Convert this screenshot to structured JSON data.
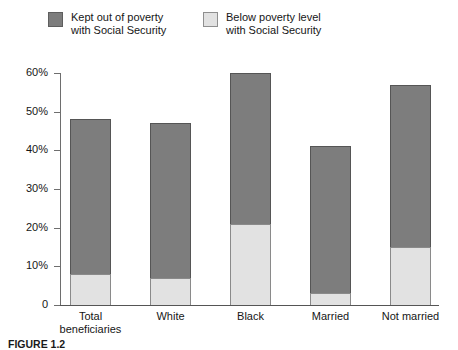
{
  "chart_data": {
    "type": "bar",
    "subtype": "stacked-bar",
    "title": "",
    "xlabel": "",
    "ylabel": "",
    "ylim": [
      0,
      60
    ],
    "ytick_values": [
      0,
      10,
      20,
      30,
      40,
      50,
      60
    ],
    "ytick_labels": [
      "0",
      "10%",
      "20%",
      "30%",
      "40%",
      "50%",
      "60%"
    ],
    "grid": false,
    "legend_position": "top-left",
    "categories": [
      "Total beneficiaries",
      "White",
      "Black",
      "Married",
      "Not married"
    ],
    "category_label_lines": [
      [
        "Total",
        "beneficiaries"
      ],
      [
        "White"
      ],
      [
        "Black"
      ],
      [
        "Married"
      ],
      [
        "Not married"
      ]
    ],
    "series": [
      {
        "name": "Below poverty level with Social Security",
        "color": "#e2e2e2",
        "values": [
          8,
          7,
          21,
          3,
          15
        ]
      },
      {
        "name": "Kept out of poverty with Social Security",
        "color": "#7d7d7d",
        "values": [
          40,
          40,
          39,
          38,
          42
        ]
      }
    ],
    "totals": [
      48,
      47,
      60,
      41,
      57
    ]
  },
  "legend": {
    "entries": [
      {
        "swatch": "dark",
        "line1": "Kept out of poverty",
        "line2": "with Social Security"
      },
      {
        "swatch": "light",
        "line1": "Below poverty level",
        "line2": "with Social Security"
      }
    ]
  },
  "caption": {
    "figure_number": "FIGURE 1.2",
    "text": ""
  },
  "colors": {
    "dark_series": "#7d7d7d",
    "light_series": "#e2e2e2",
    "axis": "#555555",
    "text": "#161616"
  }
}
